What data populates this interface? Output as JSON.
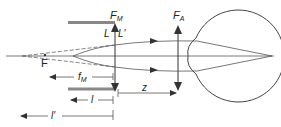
{
  "diagram": {
    "type": "optics-ray-diagram",
    "labels": {
      "magnifier_focal": "F",
      "magnifier_focal_sub": "M",
      "eye_focal": "F",
      "eye_focal_sub": "A",
      "focal_point": "F",
      "L": "L",
      "L_prime": "L'",
      "f_M": "f",
      "f_M_sub": "M",
      "l": "l",
      "l_prime": "l'",
      "z": "z"
    },
    "colors": {
      "line": "#333333",
      "ray": "#555555",
      "stop": "#888888",
      "background": "#ffffff"
    }
  }
}
